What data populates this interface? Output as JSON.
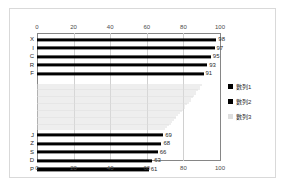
{
  "chart_data": {
    "type": "bar",
    "orientation": "horizontal",
    "title": "",
    "xlabel": "",
    "ylabel": "",
    "xlim": [
      0,
      100
    ],
    "grid": true,
    "axis_top_ticks": [
      "0",
      "20",
      "40",
      "60",
      "80",
      "100"
    ],
    "axis_bottom_ticks": [
      "0",
      "20",
      "40",
      "60",
      "80",
      "100"
    ],
    "legend_position": "right",
    "legend": [
      {
        "label": "數列1",
        "color": "#000000"
      },
      {
        "label": "數列2",
        "color": "#000000"
      },
      {
        "label": "數列3",
        "color": "#dedede"
      }
    ],
    "groups": [
      {
        "name": "top-group",
        "series": "數列1",
        "color": "#000000",
        "categories": [
          "X",
          "I",
          "C",
          "R",
          "F"
        ],
        "values": [
          98,
          97,
          95,
          93,
          91
        ]
      },
      {
        "name": "middle-group",
        "series": "數列3",
        "color": "#dedede",
        "categories": [
          "",
          "",
          "",
          "",
          "",
          "",
          "",
          "",
          "",
          "",
          "",
          "",
          "",
          "",
          "",
          "",
          "",
          "",
          "",
          "",
          "",
          "",
          "",
          "",
          "",
          ""
        ],
        "values": [
          90,
          89,
          89,
          88,
          87,
          87,
          86,
          85,
          84,
          84,
          83,
          82,
          81,
          81,
          80,
          79,
          78,
          77,
          76,
          76,
          75,
          74,
          73,
          72,
          71,
          70
        ]
      },
      {
        "name": "bottom-group",
        "series": "數列2",
        "color": "#000000",
        "categories": [
          "J",
          "Z",
          "S",
          "D",
          "P"
        ],
        "values": [
          69,
          68,
          66,
          63,
          61
        ]
      }
    ]
  },
  "colors": {
    "frame_border": "#d9d9d9",
    "axis_line": "#868686",
    "gridline": "#d0d0d0",
    "bar_dark": "#000000",
    "bar_light": "#dedede",
    "text": "#2b2b2b",
    "background": "#ffffff"
  }
}
